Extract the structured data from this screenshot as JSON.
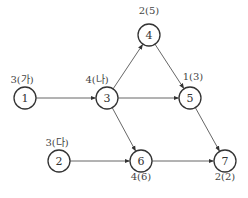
{
  "diagram": {
    "type": "network-activity-graph",
    "nodes": [
      {
        "id": "1",
        "label": "1",
        "x": 25,
        "y": 98,
        "annotation": "3(가)",
        "ax": 22,
        "ay": 77
      },
      {
        "id": "2",
        "label": "2",
        "x": 59,
        "y": 161,
        "annotation": "3(다)",
        "ax": 57,
        "ay": 140
      },
      {
        "id": "3",
        "label": "3",
        "x": 107,
        "y": 98,
        "annotation": "4(나)",
        "ax": 97,
        "ay": 77
      },
      {
        "id": "4",
        "label": "4",
        "x": 149,
        "y": 35,
        "annotation": "2(5)",
        "ax": 149,
        "ay": 11
      },
      {
        "id": "5",
        "label": "5",
        "x": 190,
        "y": 98,
        "annotation": "1(3)",
        "ax": 193,
        "ay": 77
      },
      {
        "id": "6",
        "label": "6",
        "x": 141,
        "y": 161,
        "annotation": "4(6)",
        "ax": 141,
        "ay": 177
      },
      {
        "id": "7",
        "label": "7",
        "x": 225,
        "y": 161,
        "annotation": "2(2)",
        "ax": 225,
        "ay": 177
      }
    ],
    "edges": [
      {
        "from": "1",
        "to": "3"
      },
      {
        "from": "3",
        "to": "4"
      },
      {
        "from": "3",
        "to": "5"
      },
      {
        "from": "3",
        "to": "6"
      },
      {
        "from": "4",
        "to": "5"
      },
      {
        "from": "5",
        "to": "7"
      },
      {
        "from": "2",
        "to": "6"
      },
      {
        "from": "6",
        "to": "7"
      }
    ],
    "node_radius": 11
  }
}
